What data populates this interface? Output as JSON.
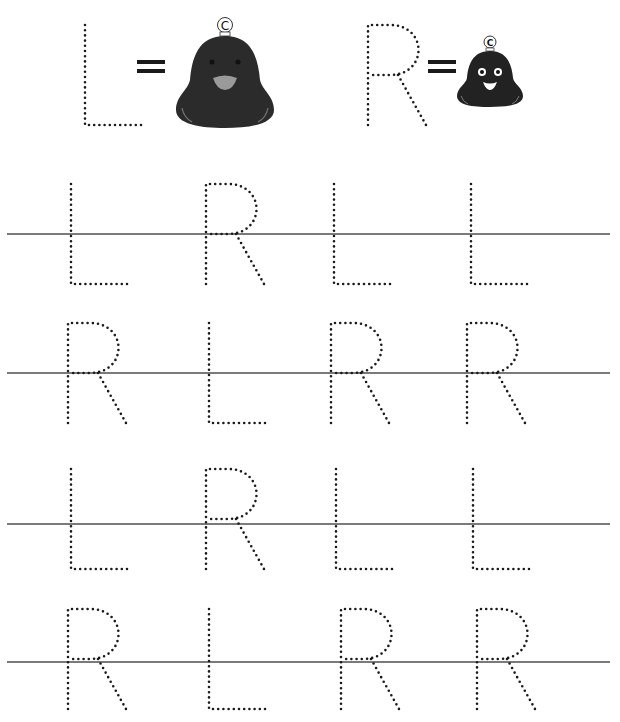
{
  "worksheet": {
    "subject": "Letter tracing: L and R",
    "legend": [
      {
        "letter": "L",
        "equals": "=",
        "picture": "large-bell-icon",
        "bell_label": "C"
      },
      {
        "letter": "R",
        "equals": "=",
        "picture": "small-bell-icon",
        "bell_label": "C"
      }
    ],
    "rows": [
      {
        "letters": [
          "L",
          "R",
          "L",
          "L"
        ]
      },
      {
        "letters": [
          "R",
          "L",
          "R",
          "R"
        ]
      },
      {
        "letters": [
          "L",
          "R",
          "L",
          "L"
        ]
      },
      {
        "letters": [
          "R",
          "L",
          "R",
          "R"
        ]
      }
    ],
    "colors": {
      "dots": "#1a1a1a",
      "guide_line": "#7a7a7a",
      "bell_body": "#2b2b2b",
      "bell_mouth": "#9a9a9a"
    }
  }
}
